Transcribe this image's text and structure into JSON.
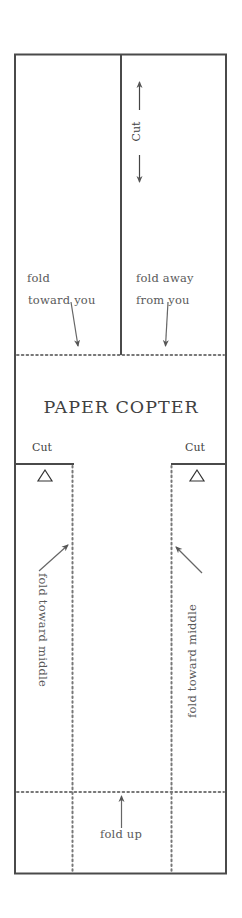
{
  "title": "PAPER COPTER",
  "top_section": {
    "cut_label": "Cut",
    "left_panel": {
      "line1": "fold",
      "line2": "toward you"
    },
    "right_panel": {
      "line1": "fold away",
      "line2": "from you"
    }
  },
  "cut_labels": {
    "left": "Cut",
    "right": "Cut"
  },
  "side_flaps": {
    "left_label": "fold toward middle",
    "right_label": "fold toward middle",
    "marker_icon": "triangle-outline"
  },
  "bottom": {
    "label": "fold up"
  },
  "colors": {
    "solid_line": "#4a4a4a",
    "dotted_line": "#777777",
    "text": "#5a5a5a",
    "background": "#ffffff"
  }
}
